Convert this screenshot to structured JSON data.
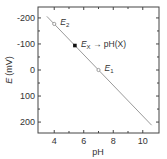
{
  "chart_data": {
    "type": "line",
    "title": "",
    "xlabel": "pH",
    "ylabel": "E (mV)",
    "ylabel_italic": "E",
    "ylabel_unit": "(mV)",
    "xlim": [
      2.9,
      11.1
    ],
    "ylim": [
      -242,
      242
    ],
    "y_inverted": true,
    "x_ticks": [
      4,
      6,
      8,
      10
    ],
    "x_minor_ticks": [
      5,
      7,
      9
    ],
    "y_ticks": [
      -200,
      -100,
      0,
      100,
      200
    ],
    "y_minor_ticks": [
      -150,
      -50,
      50,
      150
    ],
    "grid": false,
    "series": [
      {
        "name": "Nernst line",
        "color": "#9a9a9a",
        "x": [
          3.5,
          10.6
        ],
        "y": [
          -206,
          212
        ]
      }
    ],
    "points": [
      {
        "name": "E2",
        "label_main": "E",
        "label_sub": "2",
        "x": 4.0,
        "y": -177,
        "marker": "open-circle"
      },
      {
        "name": "EX",
        "label_main": "E",
        "label_sub": "X",
        "label_suffix": " → pH(X)",
        "x": 5.4,
        "y": -94,
        "marker": "filled-square"
      },
      {
        "name": "E1",
        "label_main": "E",
        "label_sub": "1",
        "x": 7.0,
        "y": 0,
        "marker": "open-circle"
      }
    ]
  }
}
